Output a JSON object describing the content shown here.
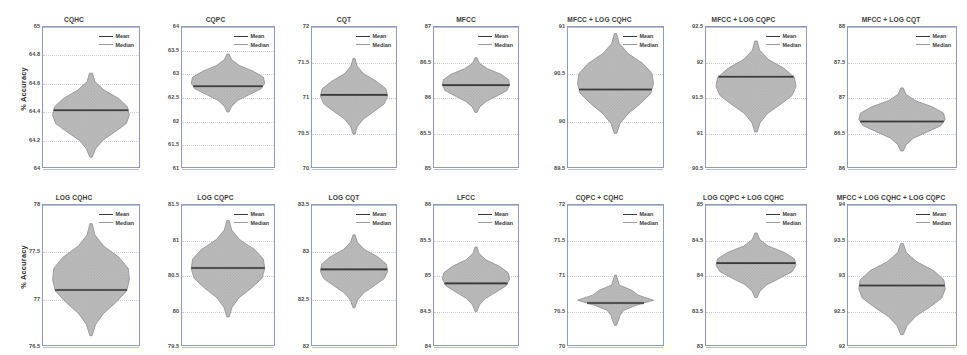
{
  "figure": {
    "ylabel": "% Accuracy",
    "legend": {
      "mean_label": "Mean",
      "median_label": "Median"
    },
    "colors": {
      "axis": "#8e9bbd",
      "grid": "#c9cfe0",
      "violin_fill": "#bdbdbd",
      "violin_edge": "#8c8c8c",
      "mean_line": "#3a3a3a",
      "median_line": "#9a9a9a",
      "text": "#3a3a3a"
    }
  },
  "chart_data": {
    "type": "violin",
    "title": "",
    "xlabel": "",
    "ylabel": "% Accuracy",
    "grid": true,
    "legend": [
      "Mean",
      "Median"
    ],
    "legend_position": "top-right",
    "panels": [
      {
        "title": "CQHC",
        "ylim": [
          64,
          65
        ],
        "yticks": [
          "64",
          "64.2",
          "64.4",
          "64.6",
          "64.8",
          "65"
        ],
        "ytick_values": [
          64,
          64.2,
          64.4,
          64.6,
          64.8,
          65
        ],
        "mean": 64.405,
        "median": 64.405,
        "whisker_low": 64.07,
        "whisker_high": 64.67,
        "width_profile": [
          0.04,
          0.1,
          0.34,
          0.72,
          0.95,
          1.0,
          0.92,
          0.62,
          0.3,
          0.12,
          0.03
        ]
      },
      {
        "title": "CQPC",
        "ylim": [
          61,
          64
        ],
        "yticks": [
          "61",
          "61.5",
          "62",
          "62.5",
          "63",
          "63.5",
          "64"
        ],
        "ytick_values": [
          61,
          61.5,
          62,
          62.5,
          63,
          63.5,
          64
        ],
        "mean": 62.73,
        "median": 62.73,
        "whisker_low": 62.18,
        "whisker_high": 63.42,
        "width_profile": [
          0.03,
          0.1,
          0.32,
          0.7,
          0.96,
          1.0,
          0.9,
          0.58,
          0.27,
          0.1,
          0.03
        ]
      },
      {
        "title": "CQT",
        "ylim": [
          70,
          72
        ],
        "yticks": [
          "70",
          "70.5",
          "71",
          "71.5",
          "72"
        ],
        "ytick_values": [
          70,
          70.5,
          71,
          71.5,
          72
        ],
        "mean": 71.03,
        "median": 71.03,
        "whisker_low": 70.47,
        "whisker_high": 71.55,
        "width_profile": [
          0.03,
          0.09,
          0.28,
          0.66,
          0.95,
          1.0,
          0.9,
          0.6,
          0.28,
          0.1,
          0.03
        ]
      },
      {
        "title": "MFCC",
        "ylim": [
          85,
          87
        ],
        "yticks": [
          "85",
          "85.5",
          "86",
          "86.5",
          "87"
        ],
        "ytick_values": [
          85,
          85.5,
          86,
          86.5,
          87
        ],
        "mean": 86.17,
        "median": 86.17,
        "whisker_low": 85.78,
        "whisker_high": 86.56,
        "width_profile": [
          0.03,
          0.1,
          0.34,
          0.74,
          0.97,
          1.0,
          0.92,
          0.62,
          0.3,
          0.11,
          0.03
        ]
      },
      {
        "title": "MFCC + LOG CQHC",
        "ylim": [
          89.5,
          91
        ],
        "yticks": [
          "89.5",
          "90",
          "90.5",
          "91"
        ],
        "ytick_values": [
          89.5,
          90,
          90.5,
          91
        ],
        "mean": 90.33,
        "median": 90.33,
        "whisker_low": 89.86,
        "whisker_high": 90.93,
        "width_profile": [
          0.03,
          0.1,
          0.33,
          0.72,
          0.96,
          1.0,
          0.93,
          0.66,
          0.34,
          0.12,
          0.03
        ]
      },
      {
        "title": "MFCC + LOG CQPC",
        "ylim": [
          90.5,
          92.5
        ],
        "yticks": [
          "90.5",
          "91",
          "91.5",
          "92",
          "92.5"
        ],
        "ytick_values": [
          90.5,
          91,
          91.5,
          92,
          92.5
        ],
        "mean": 91.79,
        "median": 91.79,
        "whisker_low": 91.0,
        "whisker_high": 92.3,
        "width_profile": [
          0.03,
          0.09,
          0.3,
          0.7,
          0.96,
          1.0,
          0.9,
          0.6,
          0.28,
          0.1,
          0.03
        ]
      },
      {
        "title": "MFCC + LOG CQT",
        "ylim": [
          86,
          88
        ],
        "yticks": [
          "86",
          "86.5",
          "87",
          "87.5",
          "88"
        ],
        "ytick_values": [
          86,
          86.5,
          87,
          87.5,
          88
        ],
        "mean": 86.65,
        "median": 86.65,
        "whisker_low": 86.23,
        "whisker_high": 87.13,
        "width_profile": [
          0.03,
          0.09,
          0.3,
          0.7,
          0.96,
          1.0,
          0.9,
          0.58,
          0.26,
          0.1,
          0.03
        ]
      },
      {
        "title": "LOG CQHC",
        "ylim": [
          76.5,
          78
        ],
        "yticks": [
          "76.5",
          "77",
          "77.5",
          "78"
        ],
        "ytick_values": [
          76.5,
          77,
          77.5,
          78
        ],
        "mean": 77.09,
        "median": 77.09,
        "whisker_low": 76.6,
        "whisker_high": 77.8,
        "width_profile": [
          0.03,
          0.1,
          0.33,
          0.73,
          0.97,
          1.0,
          0.93,
          0.66,
          0.33,
          0.12,
          0.03
        ]
      },
      {
        "title": "LOG CQPC",
        "ylim": [
          79.5,
          81.5
        ],
        "yticks": [
          "79.5",
          "80",
          "80.5",
          "81",
          "81.5"
        ],
        "ytick_values": [
          79.5,
          80,
          80.5,
          81,
          81.5
        ],
        "mean": 80.6,
        "median": 80.6,
        "whisker_low": 79.9,
        "whisker_high": 81.28,
        "width_profile": [
          0.03,
          0.1,
          0.32,
          0.72,
          0.96,
          1.0,
          0.92,
          0.64,
          0.3,
          0.11,
          0.03
        ]
      },
      {
        "title": "LOG CQT",
        "ylim": [
          82,
          83.5
        ],
        "yticks": [
          "82",
          "82.5",
          "83",
          "83.5"
        ],
        "ytick_values": [
          82,
          82.5,
          83,
          83.5
        ],
        "mean": 82.81,
        "median": 82.81,
        "whisker_low": 82.4,
        "whisker_high": 83.18,
        "width_profile": [
          0.03,
          0.1,
          0.31,
          0.7,
          0.96,
          1.0,
          0.9,
          0.6,
          0.28,
          0.1,
          0.03
        ]
      },
      {
        "title": "LFCC",
        "ylim": [
          84,
          86
        ],
        "yticks": [
          "84",
          "84.5",
          "85",
          "85.5",
          "86"
        ],
        "ytick_values": [
          84,
          84.5,
          85,
          85.5,
          86
        ],
        "mean": 84.88,
        "median": 84.88,
        "whisker_low": 84.48,
        "whisker_high": 85.4,
        "width_profile": [
          0.03,
          0.09,
          0.3,
          0.7,
          0.96,
          1.0,
          0.9,
          0.6,
          0.28,
          0.1,
          0.03
        ]
      },
      {
        "title": "CQPC + CQHC",
        "ylim": [
          70,
          72
        ],
        "yticks": [
          "70",
          "70.5",
          "71",
          "71.5",
          "72"
        ],
        "ytick_values": [
          70,
          70.5,
          71,
          71.5,
          72
        ],
        "mean": 70.6,
        "median": 70.6,
        "whisker_low": 70.28,
        "whisker_high": 71.0,
        "width_profile": [
          0.02,
          0.06,
          0.1,
          0.42,
          0.6,
          1.0,
          0.55,
          0.22,
          0.12,
          0.08,
          0.02
        ]
      },
      {
        "title": "LOG CQPC + LOG CQHC",
        "ylim": [
          83,
          85
        ],
        "yticks": [
          "83",
          "83.5",
          "84",
          "84.5",
          "85"
        ],
        "ytick_values": [
          83,
          83.5,
          84,
          84.5,
          85
        ],
        "mean": 84.17,
        "median": 84.17,
        "whisker_low": 83.68,
        "whisker_high": 84.6,
        "width_profile": [
          0.03,
          0.09,
          0.3,
          0.7,
          0.96,
          1.0,
          0.9,
          0.6,
          0.28,
          0.1,
          0.03
        ]
      },
      {
        "title": "MFCC + LOG CQHC + LOG CQPC",
        "ylim": [
          92,
          94
        ],
        "yticks": [
          "92",
          "92.5",
          "93",
          "93.5",
          "94"
        ],
        "ytick_values": [
          92,
          92.5,
          93,
          93.5,
          94
        ],
        "mean": 92.85,
        "median": 92.85,
        "whisker_low": 92.15,
        "whisker_high": 93.45,
        "width_profile": [
          0.03,
          0.1,
          0.34,
          0.74,
          0.97,
          1.0,
          0.92,
          0.64,
          0.32,
          0.12,
          0.03
        ]
      }
    ]
  }
}
